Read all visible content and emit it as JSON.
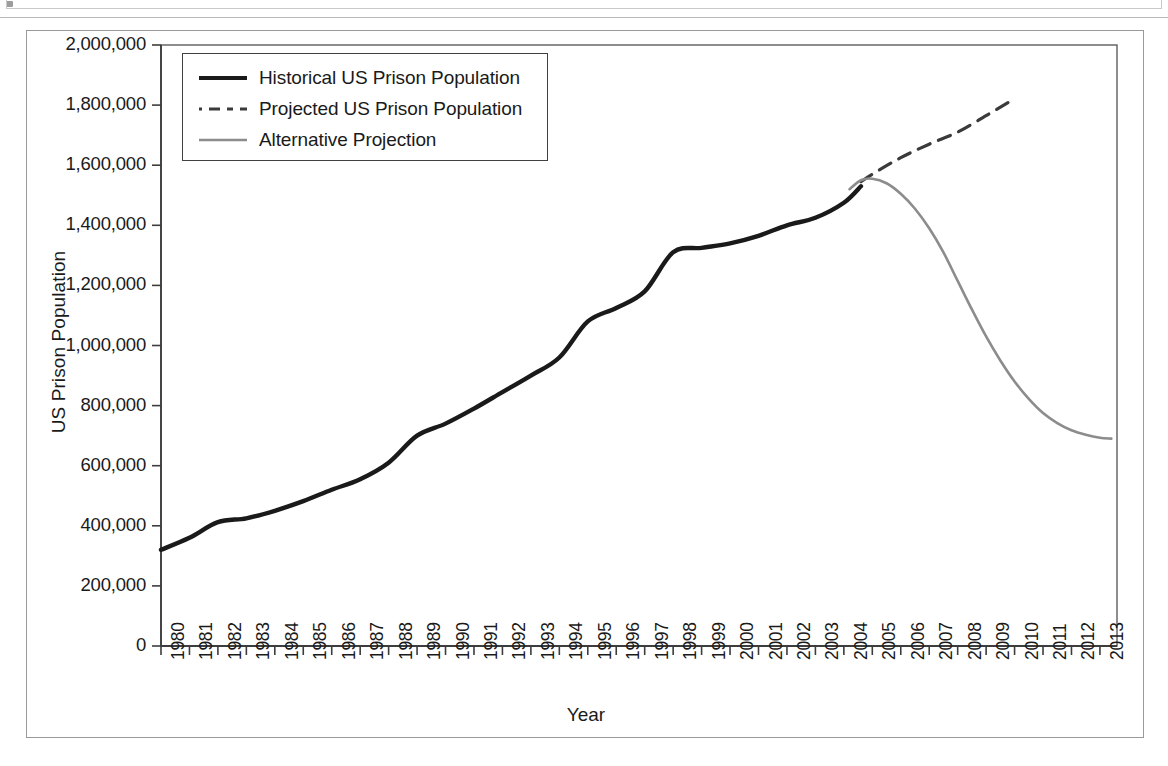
{
  "figure": {
    "y_axis_title": "US Prison Population",
    "x_axis_title": "Year"
  },
  "legend": {
    "entries": [
      {
        "label": "Historical US Prison Population",
        "style": "solid",
        "color": "#1a1a1a",
        "width": 4
      },
      {
        "label": "Projected US Prison Population",
        "style": "dashed",
        "color": "#3a3a3a",
        "width": 3
      },
      {
        "label": "Alternative Projection",
        "style": "solid",
        "color": "#8c8c8c",
        "width": 2.5
      }
    ]
  },
  "chart_data": {
    "type": "line",
    "title": "",
    "xlabel": "Year",
    "ylabel": "US Prison Population",
    "xlim": [
      1980,
      2013.6
    ],
    "ylim": [
      0,
      2000000
    ],
    "grid": false,
    "legend_position": "top-left-inside",
    "x_tick_labels": [
      "1980",
      "1981",
      "1982",
      "1983",
      "1984",
      "1985",
      "1986",
      "1987",
      "1988",
      "1989",
      "1990",
      "1991",
      "1992",
      "1993",
      "1994",
      "1995",
      "1996",
      "1997",
      "1998",
      "1999",
      "2000",
      "2001",
      "2002",
      "2003",
      "2004",
      "2005",
      "2006",
      "2007",
      "2008",
      "2009",
      "2010",
      "2011",
      "2012",
      "2013"
    ],
    "y_tick_labels": [
      "0",
      "200,000",
      "400,000",
      "600,000",
      "800,000",
      "1,000,000",
      "1,200,000",
      "1,400,000",
      "1,600,000",
      "1,800,000",
      "2,000,000"
    ],
    "y_tick_values": [
      0,
      200000,
      400000,
      600000,
      800000,
      1000000,
      1200000,
      1400000,
      1600000,
      1800000,
      2000000
    ],
    "series": [
      {
        "name": "Historical US Prison Population",
        "style": "solid",
        "color": "#1a1a1a",
        "x": [
          1980,
          1981,
          1982,
          1983,
          1984,
          1985,
          1986,
          1987,
          1988,
          1989,
          1990,
          1991,
          1992,
          1993,
          1994,
          1995,
          1996,
          1997,
          1998,
          1999,
          2000,
          2001,
          2002,
          2003,
          2004,
          2004.6
        ],
        "values": [
          320000,
          360000,
          412000,
          425000,
          450000,
          482000,
          520000,
          555000,
          610000,
          700000,
          740000,
          790000,
          845000,
          900000,
          960000,
          1080000,
          1125000,
          1180000,
          1310000,
          1325000,
          1340000,
          1365000,
          1400000,
          1425000,
          1475000,
          1530000
        ]
      },
      {
        "name": "Projected US Prison Population",
        "style": "dashed",
        "color": "#3a3a3a",
        "x": [
          2004.6,
          2005,
          2006,
          2007,
          2008,
          2009,
          2009.8
        ],
        "values": [
          1545000,
          1570000,
          1625000,
          1670000,
          1710000,
          1765000,
          1810000
        ]
      },
      {
        "name": "Alternative Projection",
        "style": "solid",
        "color": "#8c8c8c",
        "x": [
          2004.2,
          2004.6,
          2005,
          2005.5,
          2006,
          2006.5,
          2007,
          2007.5,
          2008,
          2008.5,
          2009,
          2009.5,
          2010,
          2010.5,
          2011,
          2011.5,
          2012,
          2012.5,
          2013,
          2013.4
        ],
        "values": [
          1520000,
          1550000,
          1555000,
          1540000,
          1505000,
          1455000,
          1390000,
          1310000,
          1215000,
          1120000,
          1030000,
          950000,
          880000,
          822000,
          775000,
          742000,
          718000,
          703000,
          693000,
          690000
        ]
      }
    ]
  }
}
